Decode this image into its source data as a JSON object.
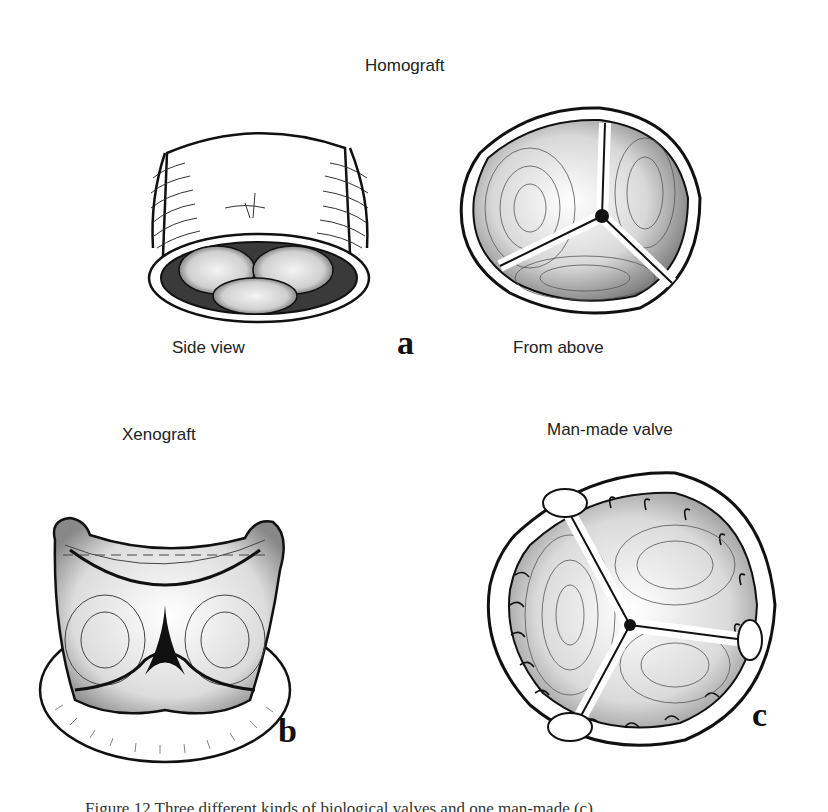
{
  "figure": {
    "title": "Homograft",
    "panels": [
      {
        "id": "a",
        "letter": "a",
        "sub_labels": {
          "left": "Side view",
          "right": "From above"
        }
      },
      {
        "id": "b",
        "letter": "b",
        "label": "Xenograft"
      },
      {
        "id": "c",
        "letter": "c",
        "label": "Man-made valve"
      }
    ],
    "caption": "Figure 12   Three different kinds of biological valves and one man-made (c)"
  }
}
